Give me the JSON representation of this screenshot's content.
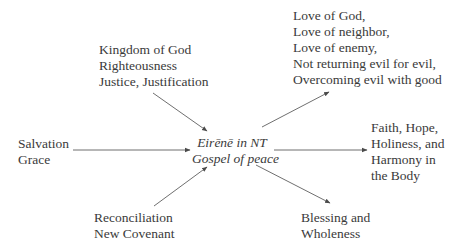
{
  "diagram": {
    "center": {
      "lines": [
        "Eirēnē in NT",
        "Gospel of peace"
      ]
    },
    "nodes": {
      "kingdom": {
        "lines": [
          "Kingdom of God",
          "Righteousness",
          "Justice, Justification"
        ]
      },
      "love": {
        "lines": [
          "Love of God,",
          "Love of neighbor,",
          "Love of enemy,",
          "Not returning evil for evil,",
          "Overcoming evil with good"
        ]
      },
      "salvation": {
        "lines": [
          "Salvation",
          "Grace"
        ]
      },
      "faith": {
        "lines": [
          "Faith, Hope,",
          "Holiness, and",
          "Harmony in",
          "the Body"
        ]
      },
      "reconciliation": {
        "lines": [
          "Reconciliation",
          "New Covenant"
        ]
      },
      "blessing": {
        "lines": [
          "Blessing and",
          "Wholeness"
        ]
      }
    },
    "edges": [
      {
        "from": "kingdom",
        "to": "center"
      },
      {
        "from": "salvation",
        "to": "center"
      },
      {
        "from": "reconciliation",
        "to": "center"
      },
      {
        "from": "center",
        "to": "love"
      },
      {
        "from": "center",
        "to": "faith"
      },
      {
        "from": "center",
        "to": "blessing"
      }
    ],
    "colors": {
      "text": "#3a3a3a",
      "arrow": "#4a4a4a",
      "background": "#ffffff"
    }
  }
}
